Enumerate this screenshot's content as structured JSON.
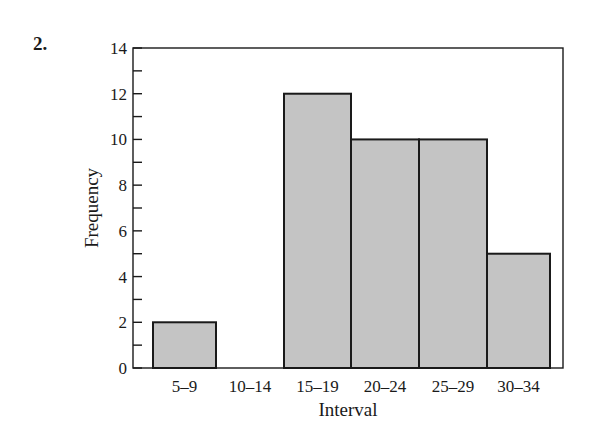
{
  "problem_number": "2.",
  "chart_data": {
    "type": "bar",
    "title": "",
    "xlabel": "Interval",
    "ylabel": "Frequency",
    "categories": [
      "5–9",
      "10–14",
      "15–19",
      "20–24",
      "25–29",
      "30–34"
    ],
    "values": [
      2,
      0,
      12,
      10,
      10,
      5
    ],
    "ylim": [
      0,
      14
    ],
    "yticks_major": [
      0,
      2,
      4,
      6,
      8,
      10,
      12,
      14
    ],
    "yticks_minor_step": 1,
    "grid": false,
    "legend": null,
    "bar_color": "#c4c4c4",
    "edge_color": "#1a1a1a"
  }
}
